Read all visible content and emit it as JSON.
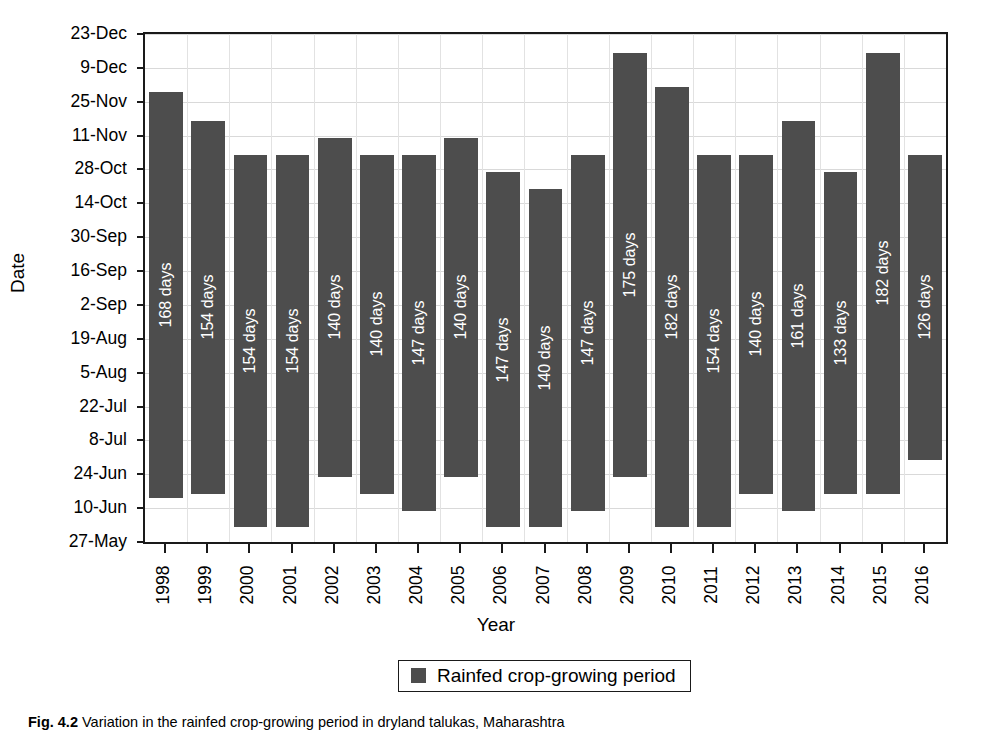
{
  "axes": {
    "y_title": "Date",
    "x_title": "Year",
    "y_ticks": [
      "23-Dec",
      "9-Dec",
      "25-Nov",
      "11-Nov",
      "28-Oct",
      "14-Oct",
      "30-Sep",
      "16-Sep",
      "2-Sep",
      "19-Aug",
      "5-Aug",
      "22-Jul",
      "8-Jul",
      "24-Jun",
      "10-Jun",
      "27-May"
    ]
  },
  "legend": {
    "label": "Rainfed crop-growing period",
    "color": "#4d4d4d"
  },
  "caption": {
    "figure_number": "Fig. 4.2",
    "text": "Variation in the rainfed crop-growing period in dryland talukas, Maharashtra"
  },
  "colors": {
    "bar": "#4d4d4d",
    "frame": "#1a1a1a",
    "grid": "#d9d9d9",
    "background": "#ffffff",
    "bar_label_text": "#ffffff"
  },
  "chart_data": {
    "type": "bar",
    "subtype": "floating-range-bar",
    "title": "",
    "xlabel": "Year",
    "ylabel": "Date",
    "ylim": [
      "27-May",
      "23-Dec"
    ],
    "y_tick_labels": [
      "27-May",
      "10-Jun",
      "24-Jun",
      "8-Jul",
      "22-Jul",
      "5-Aug",
      "19-Aug",
      "2-Sep",
      "16-Sep",
      "30-Sep",
      "14-Oct",
      "28-Oct",
      "11-Nov",
      "25-Nov",
      "9-Dec",
      "23-Dec"
    ],
    "y_tick_day_of_year": [
      147,
      161,
      175,
      189,
      203,
      217,
      231,
      245,
      259,
      273,
      287,
      301,
      315,
      329,
      343,
      357
    ],
    "grid": true,
    "legend_position": "bottom-center",
    "categories": [
      "1998",
      "1999",
      "2000",
      "2001",
      "2002",
      "2003",
      "2004",
      "2005",
      "2006",
      "2007",
      "2008",
      "2009",
      "2010",
      "2011",
      "2012",
      "2013",
      "2014",
      "2015",
      "2016"
    ],
    "series": [
      {
        "name": "Rainfed crop-growing period",
        "color": "#4d4d4d",
        "bars": [
          {
            "year": "1998",
            "label": "168 days",
            "duration_days": 168,
            "start": "14-Jun",
            "end": "29-Nov",
            "start_doy": 165,
            "end_doy": 333
          },
          {
            "year": "1999",
            "label": "154 days",
            "duration_days": 154,
            "start": "16-Jun",
            "end": "17-Nov",
            "start_doy": 167,
            "end_doy": 321
          },
          {
            "year": "2000",
            "label": "154 days",
            "duration_days": 154,
            "start": "2-Jun",
            "end": "3-Nov",
            "start_doy": 153,
            "end_doy": 307
          },
          {
            "year": "2001",
            "label": "154 days",
            "duration_days": 154,
            "start": "2-Jun",
            "end": "3-Nov",
            "start_doy": 153,
            "end_doy": 307
          },
          {
            "year": "2002",
            "label": "140 days",
            "duration_days": 140,
            "start": "23-Jun",
            "end": "10-Nov",
            "start_doy": 174,
            "end_doy": 314
          },
          {
            "year": "2003",
            "label": "140 days",
            "duration_days": 140,
            "start": "16-Jun",
            "end": "3-Nov",
            "start_doy": 167,
            "end_doy": 307
          },
          {
            "year": "2004",
            "label": "147 days",
            "duration_days": 147,
            "start": "9-Jun",
            "end": "3-Nov",
            "start_doy": 160,
            "end_doy": 307
          },
          {
            "year": "2005",
            "label": "140 days",
            "duration_days": 140,
            "start": "23-Jun",
            "end": "10-Nov",
            "start_doy": 174,
            "end_doy": 314
          },
          {
            "year": "2006",
            "label": "147 days",
            "duration_days": 147,
            "start": "2-Jun",
            "end": "27-Oct",
            "start_doy": 153,
            "end_doy": 300
          },
          {
            "year": "2007",
            "label": "140 days",
            "duration_days": 140,
            "start": "2-Jun",
            "end": "20-Oct",
            "start_doy": 153,
            "end_doy": 293
          },
          {
            "year": "2008",
            "label": "147 days",
            "duration_days": 147,
            "start": "9-Jun",
            "end": "3-Nov",
            "start_doy": 160,
            "end_doy": 307
          },
          {
            "year": "2009",
            "label": "175 days",
            "duration_days": 175,
            "start": "23-Jun",
            "end": "15-Dec",
            "start_doy": 174,
            "end_doy": 349
          },
          {
            "year": "2010",
            "label": "182 days",
            "duration_days": 182,
            "start": "2-Jun",
            "end": "1-Dec",
            "start_doy": 153,
            "end_doy": 335
          },
          {
            "year": "2011",
            "label": "154 days",
            "duration_days": 154,
            "start": "2-Jun",
            "end": "3-Nov",
            "start_doy": 153,
            "end_doy": 307
          },
          {
            "year": "2012",
            "label": "140 days",
            "duration_days": 140,
            "start": "16-Jun",
            "end": "3-Nov",
            "start_doy": 167,
            "end_doy": 307
          },
          {
            "year": "2013",
            "label": "161 days",
            "duration_days": 161,
            "start": "9-Jun",
            "end": "17-Nov",
            "start_doy": 160,
            "end_doy": 321
          },
          {
            "year": "2014",
            "label": "133 days",
            "duration_days": 133,
            "start": "16-Jun",
            "end": "27-Oct",
            "start_doy": 167,
            "end_doy": 300
          },
          {
            "year": "2015",
            "label": "182 days",
            "duration_days": 182,
            "start": "16-Jun",
            "end": "15-Dec",
            "start_doy": 167,
            "end_doy": 349
          },
          {
            "year": "2016",
            "label": "126 days",
            "duration_days": 126,
            "start": "30-Jun",
            "end": "3-Nov",
            "start_doy": 181,
            "end_doy": 307
          }
        ]
      }
    ]
  }
}
